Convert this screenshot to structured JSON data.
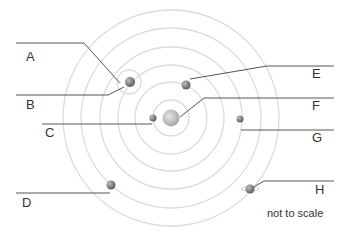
{
  "diagram": {
    "note": "not to scale",
    "labels": {
      "A": "A",
      "B": "B",
      "C": "C",
      "D": "D",
      "E": "E",
      "F": "F",
      "G": "G",
      "H": "H"
    },
    "colors": {
      "orbit": "#d9d9d9",
      "leader_line": "#555555",
      "sun": "#bdbdbd",
      "planet": "#8c8c8c"
    }
  }
}
